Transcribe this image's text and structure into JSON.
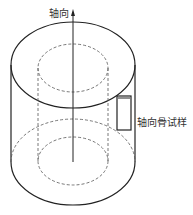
{
  "diagram": {
    "axis_label": "轴向",
    "specimen_label": "轴向骨试样",
    "line_color": "#222222",
    "dash_color": "#555555"
  }
}
